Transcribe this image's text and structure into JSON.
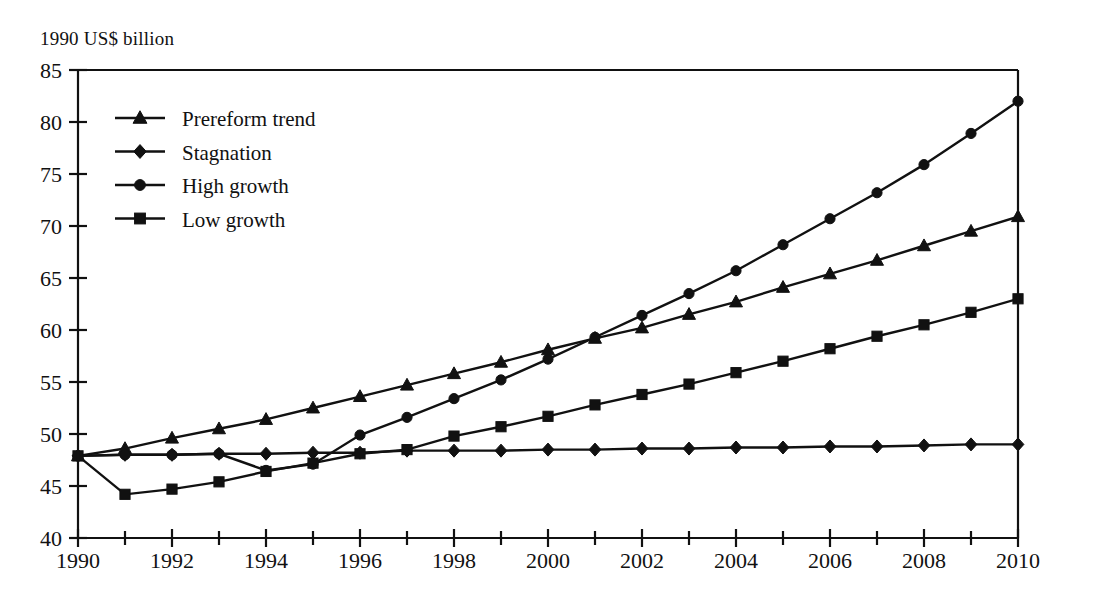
{
  "chart_data": {
    "type": "line",
    "title": "1990 US$ billion",
    "xlabel": "",
    "ylabel": "1990 US$ billion",
    "xlim": [
      1990,
      2010
    ],
    "ylim": [
      40,
      85
    ],
    "ytick_step": 5,
    "xtick_step": 1,
    "xtick_label_step": 2,
    "grid": false,
    "legend_position": "upper-left",
    "x": [
      1990,
      1991,
      1992,
      1993,
      1994,
      1995,
      1996,
      1997,
      1998,
      1999,
      2000,
      2001,
      2002,
      2003,
      2004,
      2005,
      2006,
      2007,
      2008,
      2009,
      2010
    ],
    "series": [
      {
        "name": "Prereform trend",
        "marker": "triangle",
        "values": [
          47.9,
          48.6,
          49.6,
          50.5,
          51.4,
          52.5,
          53.6,
          54.7,
          55.8,
          56.9,
          58.1,
          59.2,
          60.2,
          61.5,
          62.7,
          64.1,
          65.4,
          66.7,
          68.1,
          69.5,
          70.9
        ]
      },
      {
        "name": "Stagnation",
        "marker": "diamond",
        "values": [
          47.9,
          48.0,
          48.0,
          48.1,
          48.1,
          48.2,
          48.2,
          48.4,
          48.4,
          48.4,
          48.5,
          48.5,
          48.6,
          48.6,
          48.7,
          48.7,
          48.8,
          48.8,
          48.9,
          49.0,
          49.0
        ]
      },
      {
        "name": "High growth",
        "marker": "circle",
        "values": [
          47.9,
          48.0,
          48.0,
          48.1,
          46.5,
          47.1,
          49.9,
          51.6,
          53.4,
          55.2,
          57.2,
          59.3,
          61.4,
          63.5,
          65.7,
          68.2,
          70.7,
          73.2,
          75.9,
          78.9,
          82.0
        ]
      },
      {
        "name": "Low growth",
        "marker": "square",
        "values": [
          47.9,
          44.2,
          44.7,
          45.4,
          46.4,
          47.2,
          48.1,
          48.5,
          49.8,
          50.7,
          51.7,
          52.8,
          53.8,
          54.8,
          55.9,
          57.0,
          58.2,
          59.4,
          60.5,
          61.7,
          63.0
        ]
      }
    ],
    "ytick_labels": [
      "40",
      "45",
      "50",
      "55",
      "60",
      "65",
      "70",
      "75",
      "80",
      "85"
    ],
    "xtick_labels": [
      "1990",
      "1992",
      "1994",
      "1996",
      "1998",
      "2000",
      "2002",
      "2004",
      "2006",
      "2008",
      "2010"
    ]
  },
  "legend": {
    "items": [
      {
        "label": "Prereform trend",
        "marker": "triangle-marker-icon"
      },
      {
        "label": "Stagnation",
        "marker": "diamond-marker-icon"
      },
      {
        "label": "High growth",
        "marker": "circle-marker-icon"
      },
      {
        "label": "Low growth",
        "marker": "square-marker-icon"
      }
    ]
  }
}
